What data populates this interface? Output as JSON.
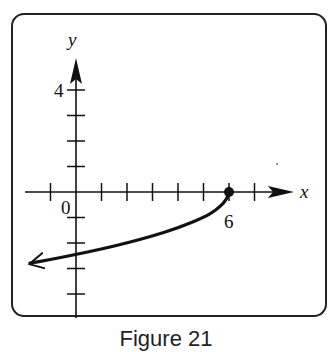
{
  "chart_data": {
    "type": "line",
    "title": "",
    "caption": "Figure 21",
    "xlabel": "x",
    "ylabel": "y",
    "xlim": [
      -3,
      9
    ],
    "ylim": [
      -5,
      6
    ],
    "grid": false,
    "x_tick_labels": [
      {
        "value": 0,
        "label": "0"
      },
      {
        "value": 6,
        "label": "6"
      }
    ],
    "y_tick_labels": [
      {
        "value": 4,
        "label": "4"
      }
    ],
    "x_ticks": [
      -1,
      1,
      2,
      3,
      4,
      5,
      6,
      7
    ],
    "y_ticks": [
      -4,
      -3,
      -2,
      -1,
      1,
      2,
      3,
      4
    ],
    "series": [
      {
        "name": "y = -sqrt(6 - x)",
        "endpoint": {
          "x": 6,
          "y": 0,
          "closed": true
        },
        "arrow_direction": "left",
        "points": [
          {
            "x": 6,
            "y": 0
          },
          {
            "x": 5.9,
            "y": -0.32
          },
          {
            "x": 5.5,
            "y": -0.71
          },
          {
            "x": 5,
            "y": -1
          },
          {
            "x": 4,
            "y": -1.41
          },
          {
            "x": 3,
            "y": -1.73
          },
          {
            "x": 2,
            "y": -2
          },
          {
            "x": 1,
            "y": -2.24
          },
          {
            "x": 0,
            "y": -2.45
          },
          {
            "x": -1,
            "y": -2.65
          },
          {
            "x": -1.8,
            "y": -2.79
          }
        ]
      }
    ]
  }
}
